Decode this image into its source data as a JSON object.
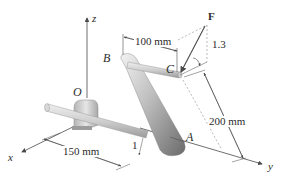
{
  "figure": {
    "axes": {
      "x": "x",
      "y": "y",
      "z": "z"
    },
    "points": {
      "O": "O",
      "A": "A",
      "B": "B",
      "C": "C"
    },
    "force": {
      "label": "F",
      "slope_rise": "1.3",
      "slope_run": "1"
    },
    "dimensions": {
      "bc_offset": "100 mm",
      "ox_length": "150 mm",
      "ab_length": "200 mm"
    },
    "colors": {
      "line": "#4a4a4a",
      "dashed": "#8a8a8a",
      "shaft": "#c8c8c8",
      "arm_dark": "#6e6e6e",
      "arm_light": "#e4e4e4"
    }
  }
}
